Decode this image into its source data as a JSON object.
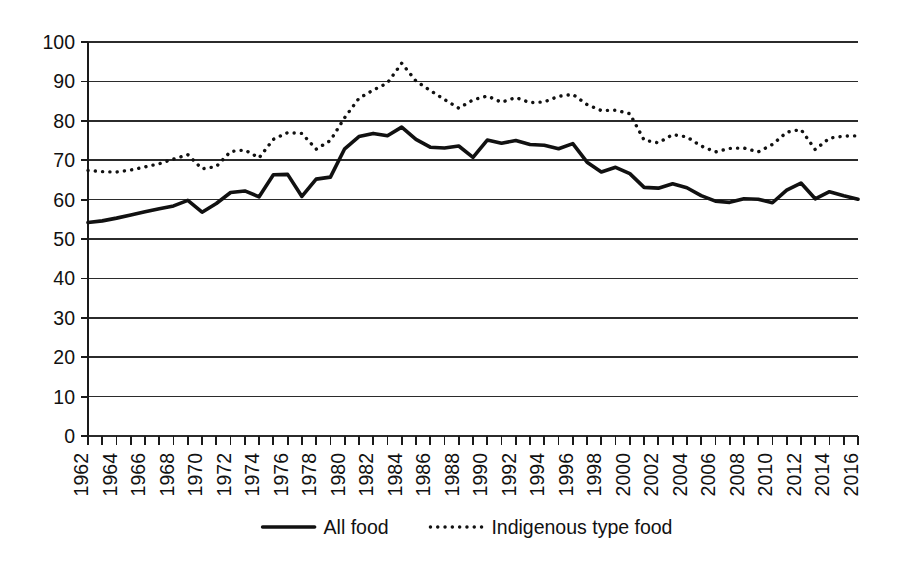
{
  "chart_data": {
    "type": "line",
    "title": "",
    "subtitle": "",
    "xlabel": "",
    "ylabel": "",
    "xlim": [
      1962,
      2016
    ],
    "ylim": [
      0,
      100
    ],
    "grid": true,
    "legend_position": "bottom",
    "y_ticks": [
      0,
      10,
      20,
      30,
      40,
      50,
      60,
      70,
      80,
      90,
      100
    ],
    "x_ticks": [
      1962,
      1964,
      1966,
      1968,
      1970,
      1972,
      1974,
      1976,
      1978,
      1980,
      1982,
      1984,
      1986,
      1988,
      1990,
      1992,
      1994,
      1996,
      1998,
      2000,
      2002,
      2004,
      2006,
      2008,
      2010,
      2012,
      2014,
      2016
    ],
    "x": [
      1962,
      1963,
      1964,
      1965,
      1966,
      1967,
      1968,
      1969,
      1970,
      1971,
      1972,
      1973,
      1974,
      1975,
      1976,
      1977,
      1978,
      1979,
      1980,
      1981,
      1982,
      1983,
      1984,
      1985,
      1986,
      1987,
      1988,
      1989,
      1990,
      1991,
      1992,
      1993,
      1994,
      1995,
      1996,
      1997,
      1998,
      1999,
      2000,
      2001,
      2002,
      2003,
      2004,
      2005,
      2006,
      2007,
      2008,
      2009,
      2010,
      2011,
      2012,
      2013,
      2014,
      2015,
      2016
    ],
    "series": [
      {
        "name": "All food",
        "style": "solid",
        "color": "#111111",
        "values": [
          54.2,
          54.6,
          55.3,
          56.1,
          56.9,
          57.7,
          58.4,
          59.8,
          56.8,
          59.0,
          61.8,
          62.2,
          60.7,
          66.3,
          66.4,
          60.8,
          65.2,
          65.7,
          72.9,
          76.0,
          76.8,
          76.2,
          78.4,
          75.3,
          73.3,
          73.1,
          73.6,
          70.7,
          75.1,
          74.3,
          75.0,
          74.0,
          73.8,
          72.9,
          74.2,
          69.5,
          67.0,
          68.2,
          66.6,
          63.1,
          62.9,
          64.0,
          63.0,
          61.0,
          59.6,
          59.3,
          60.2,
          60.1,
          59.2,
          62.4,
          64.2,
          60.2,
          62.0,
          61.0,
          60.1
        ]
      },
      {
        "name": "Indigenous type food",
        "style": "dotted",
        "color": "#111111",
        "values": [
          67.4,
          67.1,
          67.0,
          67.5,
          68.3,
          69.1,
          70.3,
          71.4,
          67.8,
          68.4,
          72.2,
          72.6,
          70.6,
          75.3,
          77.0,
          76.8,
          72.8,
          75.0,
          80.8,
          85.7,
          87.8,
          89.6,
          94.6,
          90.1,
          87.7,
          85.4,
          83.2,
          85.3,
          86.3,
          84.7,
          85.9,
          84.6,
          84.8,
          86.2,
          86.7,
          84.1,
          82.6,
          82.7,
          81.8,
          75.1,
          74.4,
          76.5,
          75.9,
          73.6,
          72.1,
          73.0,
          73.1,
          72.1,
          74.0,
          77.1,
          77.8,
          72.7,
          75.6,
          76.1,
          76.2
        ]
      }
    ]
  },
  "legend": {
    "items": [
      {
        "label": "All food",
        "marker": "solid-line"
      },
      {
        "label": "Indigenous type food",
        "marker": "dotted-line"
      }
    ]
  },
  "colors": {
    "line": "#111111",
    "grid": "#2b2b2b",
    "axis": "#1a1a1a",
    "background": "#ffffff"
  }
}
